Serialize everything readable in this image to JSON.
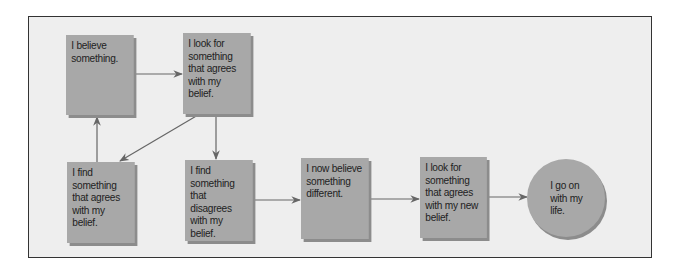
{
  "diagram": {
    "colors": {
      "background": "#eeeeee",
      "node_fill": "#a8a8a8",
      "node_shadow": "#8c8c8c",
      "arrow": "#666666",
      "frame_border": "#333333"
    },
    "nodes": [
      {
        "id": "n1",
        "shape": "rect",
        "label": "I believe\nsomething."
      },
      {
        "id": "n2",
        "shape": "rect",
        "label": "I look for\nsomething\nthat agrees\nwith my\nbelief."
      },
      {
        "id": "n3",
        "shape": "rect",
        "label": "I find\nsomething\nthat agrees\nwith my\nbelief."
      },
      {
        "id": "n4",
        "shape": "rect",
        "label": "I find\nsomething\nthat disagrees\nwith my\nbelief."
      },
      {
        "id": "n5",
        "shape": "rect",
        "label": "I now believe\nsomething\ndifferent."
      },
      {
        "id": "n6",
        "shape": "rect",
        "label": "I look for\nsomething\nthat agrees\nwith my new\nbelief."
      },
      {
        "id": "n7",
        "shape": "circle",
        "label": "I go on\nwith my\nlife."
      }
    ],
    "edges": [
      {
        "from": "n1",
        "to": "n2"
      },
      {
        "from": "n2",
        "to": "n3"
      },
      {
        "from": "n3",
        "to": "n1"
      },
      {
        "from": "n2",
        "to": "n4"
      },
      {
        "from": "n4",
        "to": "n5"
      },
      {
        "from": "n5",
        "to": "n6"
      },
      {
        "from": "n6",
        "to": "n7"
      }
    ]
  }
}
